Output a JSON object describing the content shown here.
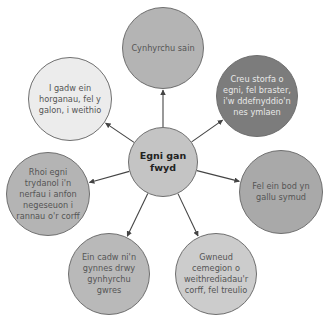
{
  "center": {
    "label": "Egni gan fwyd",
    "lines": [
      "Egni gan",
      "fwyd"
    ],
    "color": "#c4c4c4",
    "cx": 163,
    "cy": 162,
    "r": 35
  },
  "nodes": [
    {
      "id": "top",
      "text": "Cynhyrchu sain",
      "color": "#b4b4b4",
      "cx": 163,
      "cy": 48,
      "r": 41,
      "theme": "mid"
    },
    {
      "id": "top-right",
      "text": "Creu storfa o egni, fel braster, i'w ddefnyddio'n nes ymlaen",
      "color": "#7c7c7c",
      "cx": 257,
      "cy": 96,
      "r": 41,
      "theme": "dark"
    },
    {
      "id": "right",
      "text": "Fel ein bod yn gallu symud",
      "color": "#a9a9a9",
      "cx": 281,
      "cy": 192,
      "r": 42,
      "theme": "mid"
    },
    {
      "id": "bottom-right",
      "text": "Gwneud cemegion o weithrediadau'r corff, fel treulio",
      "color": "#cccccc",
      "cx": 216,
      "cy": 274,
      "r": 41,
      "theme": "light"
    },
    {
      "id": "bottom-left",
      "text": "Ein cadw ni'n gynnes drwy gynhyrchu gwres",
      "color": "#b9b9b9",
      "cx": 109,
      "cy": 274,
      "r": 41,
      "theme": "mid"
    },
    {
      "id": "left",
      "text": "Rhoi egni trydanol i'n nerfau i anfon negeseuon i rannau o'r corff",
      "color": "#b4b4b4",
      "cx": 48,
      "cy": 194,
      "r": 42,
      "theme": "mid"
    },
    {
      "id": "top-left",
      "text": "I gadw ein horganau, fel y galon, i weithio",
      "color": "#ececec",
      "cx": 70,
      "cy": 99,
      "r": 42,
      "theme": "light"
    }
  ],
  "colors": {
    "arrow": "#444444",
    "border": "#6f6f6f",
    "background": "#ffffff"
  }
}
